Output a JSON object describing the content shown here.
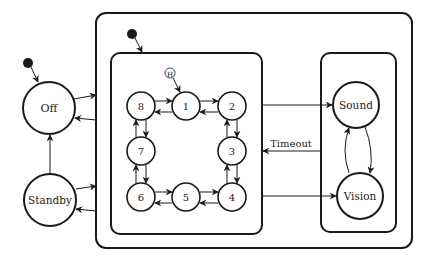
{
  "diagram": {
    "type": "state-machine",
    "states": {
      "off": "Off",
      "standby": "Standby",
      "sound": "Sound",
      "vision": "Vision",
      "s1": "1",
      "s2": "2",
      "s3": "3",
      "s4": "4",
      "s5": "5",
      "s6": "6",
      "s7": "7",
      "s8": "8"
    },
    "history_marker": "H",
    "transitions": {
      "timeout": "Timeout"
    },
    "colors": {
      "stroke": "#1a1a1a",
      "background": "#ffffff"
    }
  }
}
